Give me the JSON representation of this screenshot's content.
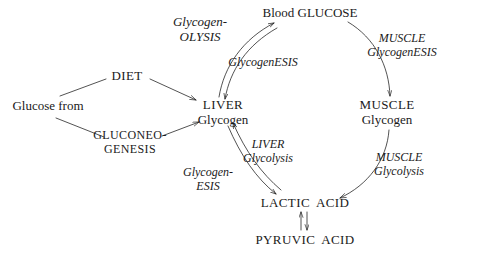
{
  "diagram": {
    "background_color": "#ffffff",
    "ink_color": "#1a1a1a",
    "nodes": [
      {
        "id": "glucose-from",
        "lines": [
          "Glucose from"
        ],
        "x": 48,
        "y": 106
      },
      {
        "id": "diet",
        "lines": [
          "DIET"
        ],
        "x": 127,
        "y": 76
      },
      {
        "id": "gluconeogenesis",
        "lines": [
          "GLUCONEO-",
          "GENESIS"
        ],
        "x": 130,
        "y": 142
      },
      {
        "id": "liver-glycogen",
        "lines": [
          "LIVER",
          "Glycogen"
        ],
        "x": 223,
        "y": 112
      },
      {
        "id": "blood-glucose",
        "lines": [
          "Blood GLUCOSE"
        ],
        "x": 310,
        "y": 13
      },
      {
        "id": "muscle-glycogen",
        "lines": [
          "MUSCLE",
          "Glycogen"
        ],
        "x": 387,
        "y": 112
      },
      {
        "id": "lactic-acid",
        "lines": [
          "LACTIC  ACID"
        ],
        "x": 305,
        "y": 203
      },
      {
        "id": "pyruvic-acid",
        "lines": [
          "PYRUVIC  ACID"
        ],
        "x": 305,
        "y": 240
      }
    ],
    "labels": [
      {
        "id": "glycogenolysis",
        "lines": [
          "Glycogen-",
          "OLYSIS"
        ],
        "x": 200,
        "y": 30
      },
      {
        "id": "glycogenesis",
        "lines": [
          "GlycogenESIS"
        ],
        "x": 263,
        "y": 63
      },
      {
        "id": "muscle-glycogenesis",
        "lines": [
          "MUSCLE",
          "GlycogenESIS"
        ],
        "x": 402,
        "y": 46
      },
      {
        "id": "muscle-glycolysis",
        "lines": [
          "MUSCLE",
          "Glycolysis"
        ],
        "x": 399,
        "y": 165
      },
      {
        "id": "liver-glycolysis",
        "lines": [
          "LIVER",
          "Glycolysis"
        ],
        "x": 268,
        "y": 152
      },
      {
        "id": "glycogenesis-liver",
        "lines": [
          "Glycogen-",
          "ESIS"
        ],
        "x": 208,
        "y": 180
      }
    ],
    "arrows": [
      {
        "id": "glucose-to-diet",
        "style": "single-line",
        "from": "glucose-from",
        "to": "diet",
        "arrowhead": "none"
      },
      {
        "id": "diet-to-liver",
        "style": "single-line",
        "from": "diet",
        "to": "liver-glycogen",
        "arrowhead": "end"
      },
      {
        "id": "glucose-to-gluconeogenesis",
        "style": "single-line",
        "from": "glucose-from",
        "to": "gluconeogenesis",
        "arrowhead": "none"
      },
      {
        "id": "gluconeogenesis-to-liver",
        "style": "single-line",
        "from": "gluconeogenesis",
        "to": "liver-glycogen",
        "arrowhead": "end"
      },
      {
        "id": "liver-blood-glucose",
        "style": "double-curve",
        "from": "liver-glycogen",
        "to": "blood-glucose",
        "arrowhead": "both"
      },
      {
        "id": "blood-glucose-to-muscle",
        "style": "single-curve",
        "from": "blood-glucose",
        "to": "muscle-glycogen",
        "arrowhead": "end"
      },
      {
        "id": "muscle-to-lactic",
        "style": "single-curve",
        "from": "muscle-glycogen",
        "to": "lactic-acid",
        "arrowhead": "end"
      },
      {
        "id": "liver-glycogen-to-lactic",
        "style": "double-curve",
        "from": "liver-glycogen",
        "to": "lactic-acid",
        "arrowhead": "both"
      },
      {
        "id": "lactic-pyruvic",
        "style": "double-line",
        "from": "lactic-acid",
        "to": "pyruvic-acid",
        "arrowhead": "both"
      }
    ]
  }
}
